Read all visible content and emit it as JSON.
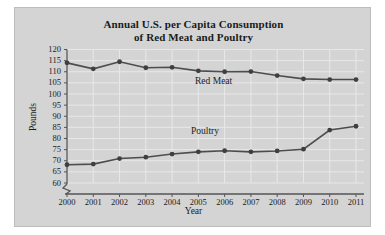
{
  "chart_data": {
    "type": "line",
    "title": "Annual U.S. per Capita Consumption of Red Meat and Poultry",
    "title_line1": "Annual U.S. per Capita Consumption",
    "title_line2": "of Red Meat and Poultry",
    "xlabel": "Year",
    "ylabel": "Pounds",
    "categories": [
      2000,
      2001,
      2002,
      2003,
      2004,
      2005,
      2006,
      2007,
      2008,
      2009,
      2010,
      2011
    ],
    "x_tick_labels": [
      "2000",
      "2001",
      "2002",
      "2003",
      "2004",
      "2005",
      "2006",
      "2007",
      "2008",
      "2009",
      "2010",
      "2011"
    ],
    "y_tick_labels": [
      "120",
      "115",
      "110",
      "105",
      "100",
      "95",
      "90",
      "85",
      "80",
      "75",
      "70",
      "65",
      "60"
    ],
    "y_tick_values": [
      120,
      115,
      110,
      105,
      100,
      95,
      90,
      85,
      80,
      75,
      70,
      65,
      60
    ],
    "ylim": [
      60,
      120
    ],
    "xlim": [
      2000,
      2011
    ],
    "axis_break": true,
    "grid": true,
    "legend_position": "inline-labels",
    "series": [
      {
        "name": "Red Meat",
        "label": "Red Meat",
        "color": "#4d4d4d",
        "values": [
          114.0,
          111.3,
          114.5,
          111.8,
          112.0,
          110.4,
          110.0,
          110.1,
          108.3,
          106.8,
          106.5,
          106.5
        ]
      },
      {
        "name": "Poultry",
        "label": "Poultry",
        "color": "#4d4d4d",
        "values": [
          68.2,
          68.5,
          71.0,
          71.6,
          73.0,
          74.0,
          74.5,
          74.0,
          74.4,
          75.2,
          83.8,
          85.5
        ]
      }
    ]
  },
  "style": {
    "panel_background": "#d4d4d4",
    "page_background": "#ffffff",
    "grid_color": "#e8e8e8",
    "axis_color": "#555555",
    "line_color": "#4d4d4d",
    "marker_color": "#3f3f3f",
    "text_color": "#1b1b1b"
  }
}
